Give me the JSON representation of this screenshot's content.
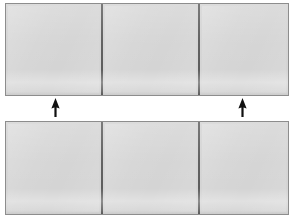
{
  "figure": {
    "background_color": "#ffffff",
    "panel_fill_color": "#d4d4d4",
    "panel_border_color": "#8d8d8d",
    "divider_color": "#5d5d5d",
    "arrow_color": "#111111",
    "canvas": {
      "width": 295,
      "height": 220
    }
  },
  "rows": [
    {
      "id": "top-assembly",
      "label": "Upper assembly",
      "position": {
        "x": 5,
        "y": 3,
        "width": 284,
        "height": 93
      },
      "panels": [
        {
          "id": "top-panel-1",
          "label": "Upper left panel",
          "width": 95
        },
        {
          "id": "top-panel-2",
          "label": "Upper middle panel",
          "width": 97
        },
        {
          "id": "top-panel-3",
          "label": "Upper right panel",
          "width": 90
        }
      ]
    },
    {
      "id": "bottom-assembly",
      "label": "Lower assembly",
      "position": {
        "x": 5,
        "y": 121,
        "width": 284,
        "height": 94
      },
      "panels": [
        {
          "id": "bottom-panel-1",
          "label": "Lower left panel",
          "width": 95
        },
        {
          "id": "bottom-panel-2",
          "label": "Lower middle panel",
          "width": 97
        },
        {
          "id": "bottom-panel-3",
          "label": "Lower right panel",
          "width": 90
        }
      ]
    }
  ],
  "arrows": [
    {
      "id": "arrow-left",
      "label": "Left upward pointer",
      "direction": "up",
      "position": {
        "x": 50,
        "y": 98,
        "width": 11,
        "height": 19
      }
    },
    {
      "id": "arrow-right",
      "label": "Right upward pointer",
      "direction": "up",
      "position": {
        "x": 237,
        "y": 98,
        "width": 11,
        "height": 19
      }
    }
  ]
}
